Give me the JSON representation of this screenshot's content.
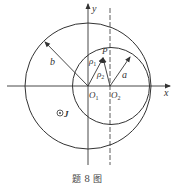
{
  "figure": {
    "caption": "题 8 图",
    "colors": {
      "stroke": "#333333",
      "background": "#ffffff"
    }
  },
  "axes": {
    "x_label": "x",
    "y_label": "y"
  },
  "circles": [
    {
      "name": "outer-circle",
      "center_label": "O1",
      "radius_label": "b"
    },
    {
      "name": "inner-circle",
      "center_label": "O2",
      "radius_label": "a"
    }
  ],
  "labels": {
    "O1_main": "O",
    "O1_sub": "1",
    "O2_main": "O",
    "O2_sub": "2",
    "P": "P",
    "rho1_main": "ρ",
    "rho1_sub": "1",
    "rho2_main": "ρ",
    "rho2_sub": "2",
    "a": "a",
    "b": "b",
    "current_symbol": "⊙",
    "current_label": "J"
  }
}
